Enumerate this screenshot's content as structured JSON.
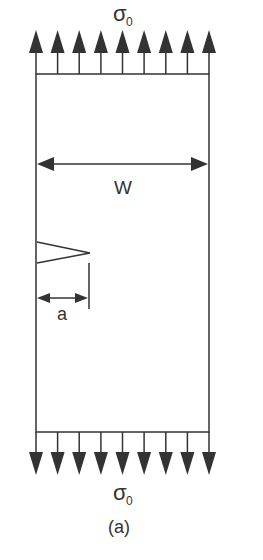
{
  "diagram": {
    "labels": {
      "top_stress": "σ",
      "top_stress_sub": "0",
      "bottom_stress": "σ",
      "bottom_stress_sub": "0",
      "width": "W",
      "crack_length": "a",
      "caption": "(a)"
    },
    "arrows": {
      "count_top": 9,
      "count_bottom": 9,
      "top_direction": "up",
      "bottom_direction": "down"
    },
    "colors": {
      "line": "#333333",
      "arrow_fill": "#333333",
      "background": "#ffffff"
    }
  }
}
